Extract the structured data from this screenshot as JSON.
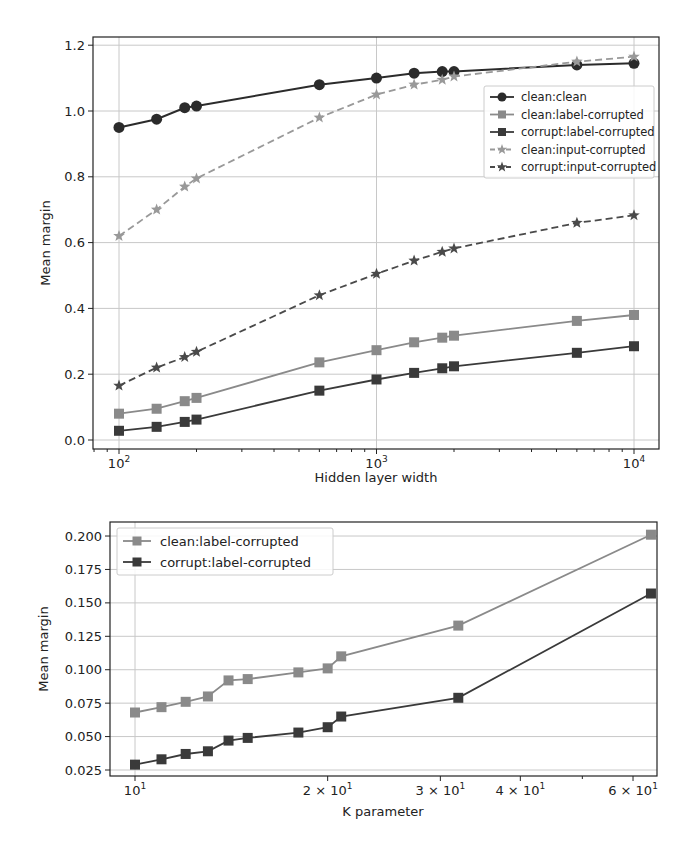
{
  "chart_data": [
    {
      "type": "line",
      "title": "",
      "xlabel": "Hidden layer width",
      "ylabel": "Mean margin",
      "xscale": "log",
      "xlim": [
        80,
        13000
      ],
      "ylim": [
        -0.03,
        1.23
      ],
      "grid": true,
      "legend_position": "center right",
      "x_tick_labels": [
        "10^2",
        "10^3",
        "10^4"
      ],
      "y_tick_labels": [
        "0.0",
        "0.2",
        "0.4",
        "0.6",
        "0.8",
        "1.0",
        "1.2"
      ],
      "x": [
        100,
        140,
        180,
        200,
        600,
        1000,
        1400,
        1800,
        2000,
        6000,
        10000
      ],
      "series": [
        {
          "name": "clean:clean",
          "marker": "circle",
          "linestyle": "solid",
          "color": "#2b2b2b",
          "values": [
            0.95,
            0.975,
            1.01,
            1.015,
            1.08,
            1.1,
            1.115,
            1.12,
            1.12,
            1.14,
            1.145
          ]
        },
        {
          "name": "clean:label-corrupted",
          "marker": "square",
          "linestyle": "solid",
          "color": "#8a8a8a",
          "values": [
            0.08,
            0.095,
            0.118,
            0.128,
            0.236,
            0.273,
            0.297,
            0.311,
            0.317,
            0.362,
            0.38
          ]
        },
        {
          "name": "corrupt:label-corrupted",
          "marker": "square",
          "linestyle": "solid",
          "color": "#3a3a3a",
          "values": [
            0.028,
            0.04,
            0.055,
            0.062,
            0.15,
            0.184,
            0.204,
            0.218,
            0.224,
            0.265,
            0.285
          ]
        },
        {
          "name": "clean:input-corrupted",
          "marker": "star",
          "linestyle": "dashed",
          "color": "#999999",
          "values": [
            0.62,
            0.7,
            0.77,
            0.795,
            0.98,
            1.05,
            1.08,
            1.095,
            1.105,
            1.15,
            1.165
          ]
        },
        {
          "name": "corrupt:input-corrupted",
          "marker": "star",
          "linestyle": "dashed",
          "color": "#4a4a4a",
          "values": [
            0.165,
            0.22,
            0.252,
            0.268,
            0.44,
            0.505,
            0.545,
            0.572,
            0.582,
            0.66,
            0.683
          ]
        }
      ]
    },
    {
      "type": "line",
      "title": "",
      "xlabel": "K parameter",
      "ylabel": "Mean margin",
      "xscale": "log",
      "xlim": [
        9.1,
        69
      ],
      "ylim": [
        0.0205,
        0.211
      ],
      "grid": true,
      "legend_position": "upper left",
      "x_tick_labels": [
        "10^1",
        "2 × 10^1",
        "3 × 10^1",
        "4 × 10^1",
        "6 × 10^1"
      ],
      "y_tick_labels": [
        "0.025",
        "0.050",
        "0.075",
        "0.100",
        "0.125",
        "0.150",
        "0.175",
        "0.200"
      ],
      "x": [
        10,
        11,
        12,
        13,
        14,
        15,
        18,
        20,
        21,
        32,
        64
      ],
      "series": [
        {
          "name": "clean:label-corrupted",
          "marker": "square",
          "linestyle": "solid",
          "color": "#8a8a8a",
          "values": [
            0.068,
            0.072,
            0.076,
            0.08,
            0.092,
            0.093,
            0.098,
            0.101,
            0.11,
            0.133,
            0.201
          ]
        },
        {
          "name": "corrupt:label-corrupted",
          "marker": "square",
          "linestyle": "solid",
          "color": "#3a3a3a",
          "values": [
            0.029,
            0.033,
            0.037,
            0.039,
            0.047,
            0.049,
            0.053,
            0.057,
            0.065,
            0.079,
            0.157
          ]
        }
      ]
    }
  ],
  "top": {
    "xlabel": "Hidden layer width",
    "ylabel": "Mean margin",
    "xticks": [
      {
        "base": "10",
        "exp": "2"
      },
      {
        "base": "10",
        "exp": "3"
      },
      {
        "base": "10",
        "exp": "4"
      }
    ],
    "yticks": [
      "0.0",
      "0.2",
      "0.4",
      "0.6",
      "0.8",
      "1.0",
      "1.2"
    ],
    "legend": [
      "clean:clean",
      "clean:label-corrupted",
      "corrupt:label-corrupted",
      "clean:input-corrupted",
      "corrupt:input-corrupted"
    ]
  },
  "bottom": {
    "xlabel": "K parameter",
    "ylabel": "Mean margin",
    "xticks": [
      {
        "pre": "",
        "base": "10",
        "exp": "1"
      },
      {
        "pre": "2 × ",
        "base": "10",
        "exp": "1"
      },
      {
        "pre": "3 × ",
        "base": "10",
        "exp": "1"
      },
      {
        "pre": "4 × ",
        "base": "10",
        "exp": "1"
      },
      {
        "pre": "6 × ",
        "base": "10",
        "exp": "1"
      }
    ],
    "yticks": [
      "0.025",
      "0.050",
      "0.075",
      "0.100",
      "0.125",
      "0.150",
      "0.175",
      "0.200"
    ],
    "legend": [
      "clean:label-corrupted",
      "corrupt:label-corrupted"
    ]
  }
}
